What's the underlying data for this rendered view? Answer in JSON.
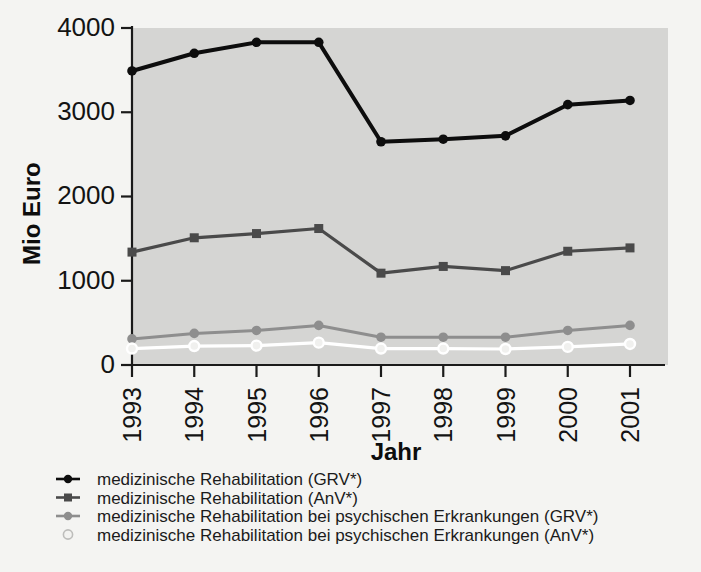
{
  "chart_data": {
    "type": "line",
    "title": "",
    "xlabel": "Jahr",
    "ylabel": "Mio Euro",
    "categories": [
      "1993",
      "1994",
      "1995",
      "1996",
      "1997",
      "1998",
      "1999",
      "2000",
      "2001"
    ],
    "x": [
      1993,
      1994,
      1995,
      1996,
      1997,
      1998,
      1999,
      2000,
      2001
    ],
    "ylim": [
      0,
      4000
    ],
    "yticks": [
      0,
      1000,
      2000,
      3000,
      4000
    ],
    "ytick_labels": [
      "0",
      "1000",
      "2000",
      "3000",
      "4000"
    ],
    "grid": false,
    "legend_position": "below-axes",
    "series": [
      {
        "name": "medizinische Rehabilitation (GRV*)",
        "color": "#0d0d0d",
        "marker": "filled-circle",
        "line_width": 4.0,
        "values": [
          3490,
          3700,
          3830,
          3830,
          2650,
          2680,
          2720,
          3090,
          3140
        ]
      },
      {
        "name": "medizinische Rehabilitation (AnV*)",
        "color": "#4a4a4a",
        "marker": "filled-square",
        "line_width": 3.2,
        "values": [
          1340,
          1510,
          1560,
          1620,
          1090,
          1170,
          1120,
          1350,
          1390
        ]
      },
      {
        "name": "medizinische Rehabilitation bei psychischen Erkrankungen (GRV*)",
        "color": "#8e8e8e",
        "marker": "filled-circle",
        "line_width": 3.0,
        "values": [
          310,
          375,
          410,
          470,
          330,
          330,
          330,
          410,
          470
        ]
      },
      {
        "name": "medizinische Rehabilitation bei psychischen Erkrankungen (AnV*)",
        "color": "#ffffff",
        "marker": "open-circle",
        "line_width": 3.2,
        "values": [
          195,
          225,
          230,
          265,
          195,
          195,
          190,
          215,
          250
        ]
      }
    ]
  },
  "legend": {
    "items": [
      {
        "label": "medizinische Rehabilitation (GRV*)",
        "marker": "filled-circle-with-rule",
        "color": "#0d0d0d"
      },
      {
        "label": "medizinische Rehabilitation (AnV*)",
        "marker": "filled-square-with-rule",
        "color": "#4a4a4a"
      },
      {
        "label": "medizinische Rehabilitation bei psychischen Erkrankungen (GRV*)",
        "marker": "filled-circle-with-rule",
        "color": "#8e8e8e"
      },
      {
        "label": "medizinische Rehabilitation bei psychischen Erkrankungen (AnV*)",
        "marker": "open-circle",
        "color": "#ffffff"
      }
    ]
  },
  "colors": {
    "page_background": "#f4f4f2",
    "plot_background": "#d5d5d3",
    "axis": "#1a1a1a",
    "text": "#131313"
  }
}
